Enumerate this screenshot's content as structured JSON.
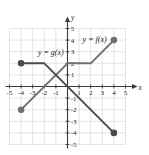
{
  "figure": {
    "name": "piecewise-functions-graph",
    "background": "#ffffff"
  },
  "chart_data": {
    "type": "line",
    "title": "",
    "xlabel": "x",
    "ylabel": "y",
    "xlim": [
      -5,
      5
    ],
    "ylim": [
      -5,
      5
    ],
    "grid": true,
    "grid_color": "#c9c9d4",
    "axis_color": "#3a3a3a",
    "x_ticks": [
      -5,
      -4,
      -3,
      -2,
      -1,
      1,
      2,
      3,
      4,
      5
    ],
    "y_ticks": [
      5,
      4,
      3,
      2,
      1,
      -1,
      -2,
      -3,
      -4,
      -5
    ],
    "x_tick_labels": [
      "-5",
      "-4",
      "-3",
      "-2",
      "-1",
      "1",
      "2",
      "3",
      "4",
      "5"
    ],
    "y_tick_labels": [
      "5",
      "4",
      "3",
      "2",
      "1",
      "-1",
      "-2",
      "-3",
      "-4",
      "-5"
    ],
    "series": [
      {
        "name": "f",
        "label": "y = f(x)",
        "color": "#6f6f78",
        "points": [
          [
            -4,
            -2
          ],
          [
            0,
            2
          ],
          [
            2,
            2
          ],
          [
            4,
            4
          ]
        ],
        "endpoints": [
          {
            "x": -4,
            "y": -2,
            "filled": true
          },
          {
            "x": 4,
            "y": 4,
            "filled": true
          }
        ],
        "label_position": {
          "x": 1.3,
          "y": 3.85
        }
      },
      {
        "name": "g",
        "label": "y = g(x)",
        "color": "#4a4a52",
        "points": [
          [
            -4,
            2
          ],
          [
            -2,
            2
          ],
          [
            4,
            -4
          ]
        ],
        "endpoints": [
          {
            "x": -4,
            "y": 2,
            "filled": true
          },
          {
            "x": 4,
            "y": -4,
            "filled": true
          }
        ],
        "label_position": {
          "x": -2.55,
          "y": 2.7
        }
      }
    ]
  },
  "labels": {
    "x_axis": "x",
    "y_axis": "y",
    "f_curve": "y = f(x)",
    "g_curve": "y = g(x)"
  }
}
